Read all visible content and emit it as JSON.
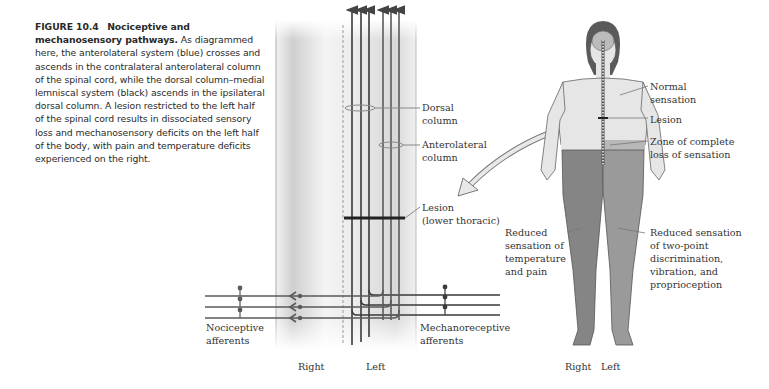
{
  "caption": {
    "figure_number": "FIGURE 10.4",
    "title": "Nociceptive and mechanosensory pathways.",
    "body": "As diagrammed here, the anterolateral system (blue) crosses and ascends in the contralateral anterolateral column of the spinal cord, while the dorsal column–medial lemniscal system (black) ascends in the ipsilateral dorsal column. A lesion restricted to the left half of the spinal cord results in dissociated sensory loss and mechanosensory deficits on the left half of the body, with pain and temperature deficits experienced on the right."
  },
  "spinal_diagram": {
    "labels": {
      "dorsal_column": [
        "Dorsal",
        "column"
      ],
      "anterolateral_column": [
        "Anterolateral",
        "column"
      ],
      "lesion": [
        "Lesion",
        "(lower thoracic)"
      ],
      "nociceptive": [
        "Nociceptive",
        "afferents"
      ],
      "mechanoreceptive": [
        "Mechanoreceptive",
        "afferents"
      ],
      "right": "Right",
      "left": "Left"
    }
  },
  "body_figure": {
    "labels": {
      "normal": [
        "Normal",
        "sensation"
      ],
      "lesion": "Lesion",
      "zone": [
        "Zone of complete",
        "loss of sensation"
      ],
      "reduced_temp": [
        "Reduced",
        "sensation of",
        "temperature",
        "and pain"
      ],
      "reduced_twopoint": [
        "Reduced sensation",
        "of two-point",
        "discrimination,",
        "vibration, and",
        "proprioception"
      ],
      "right": "Right",
      "left": "Left"
    }
  },
  "colors": {
    "skin": "#e6e6e6",
    "affected_right": "#858585",
    "affected_left": "#9a9a9a",
    "pathway": "#555555",
    "zone": "#b8b8b8"
  }
}
